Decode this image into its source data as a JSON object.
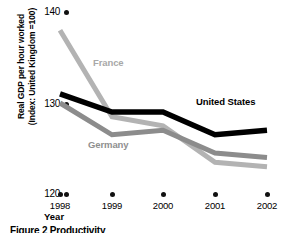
{
  "chart_data": {
    "type": "line",
    "title": "",
    "caption": "Figure 2  Productivity",
    "xlabel": "Year",
    "ylabel": "Real GDP per hour worked (Index: United Kingdom =100)",
    "ylabel_line1": "Real GDP per hour worked",
    "ylabel_line2": "(Index: United Kingdom =100)",
    "categories": [
      "1998",
      "1999",
      "2000",
      "2001",
      "2002"
    ],
    "x": [
      1998,
      1999,
      2000,
      2001,
      2002
    ],
    "yticks": [
      "120",
      "130",
      "140"
    ],
    "ylim": [
      120,
      140
    ],
    "grid": false,
    "legend": "inline-labels",
    "series": [
      {
        "name": "France",
        "color": "#b3b3b3",
        "values": [
          138.0,
          128.5,
          127.5,
          123.5,
          123.0
        ]
      },
      {
        "name": "United States",
        "color": "#000000",
        "values": [
          131.0,
          129.0,
          129.0,
          126.5,
          127.0
        ]
      },
      {
        "name": "Germany",
        "color": "#8c8c8c",
        "values": [
          130.0,
          126.5,
          127.0,
          124.5,
          124.0
        ]
      }
    ]
  },
  "labels": {
    "france": "France",
    "germany": "Germany",
    "united_states": "United States",
    "year": "Year",
    "y_line1": "Real GDP per hour worked",
    "y_line2": "(Index: United Kingdom =100)",
    "tick_140": "140",
    "tick_130": "130",
    "tick_120": "120",
    "year_1998": "1998",
    "year_1999": "1999",
    "year_2000": "2000",
    "year_2001": "2001",
    "year_2002": "2002",
    "caption": "Figure 2  Productivity"
  },
  "colors": {
    "france": "#b3b3b3",
    "germany": "#8c8c8c",
    "united_states": "#000000",
    "axis_text": "#000000",
    "background": "#ffffff"
  }
}
